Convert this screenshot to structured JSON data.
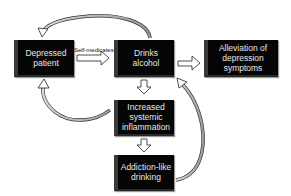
{
  "diagram": {
    "nodes": [
      {
        "id": "depressed-patient",
        "label": "Depressed patient"
      },
      {
        "id": "drinks-alcohol",
        "label": "Drinks alcohol"
      },
      {
        "id": "alleviation",
        "label": "Alleviation of depression symptoms"
      },
      {
        "id": "inflammation",
        "label": "Increased systemic inflammation"
      },
      {
        "id": "addiction",
        "label": "Addiction-like drinking"
      }
    ],
    "edge_labels": {
      "self_medicates": "Self-medicates"
    },
    "edges": [
      {
        "from": "depressed-patient",
        "to": "drinks-alcohol",
        "label": "Self-medicates"
      },
      {
        "from": "drinks-alcohol",
        "to": "alleviation"
      },
      {
        "from": "drinks-alcohol",
        "to": "inflammation"
      },
      {
        "from": "inflammation",
        "to": "addiction"
      },
      {
        "from": "drinks-alcohol",
        "to": "depressed-patient",
        "style": "curved-top"
      },
      {
        "from": "inflammation",
        "to": "depressed-patient",
        "style": "curved"
      },
      {
        "from": "addiction",
        "to": "drinks-alcohol",
        "style": "curved"
      }
    ]
  }
}
